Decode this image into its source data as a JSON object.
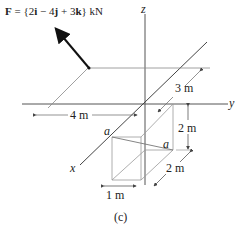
{
  "figure": {
    "force_label": {
      "prefix": "F",
      "equation": " = {2",
      "i": "i",
      "m1": " − 4",
      "j": "j",
      "m2": " + 3",
      "k": "k",
      "suffix": "} kN"
    },
    "axes": {
      "x": "x",
      "y": "y",
      "z": "z"
    },
    "dimensions": {
      "d_4m": "4 m",
      "d_3m": "3 m",
      "d_2m_vertical": "2 m",
      "d_2m_depth": "2 m",
      "d_1m": "1 m"
    },
    "points": {
      "a_left": "a",
      "a_right": "a"
    },
    "caption": "(c)",
    "colors": {
      "line": "#555555",
      "force_arrow": "#111111",
      "text": "#222222"
    }
  }
}
